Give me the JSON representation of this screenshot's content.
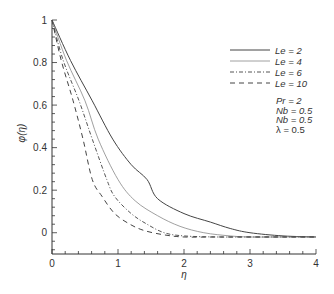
{
  "chart_data": {
    "type": "line",
    "title": "",
    "xlabel": "η",
    "ylabel": "φ(η)",
    "xlim": [
      0,
      4
    ],
    "ylim": [
      -0.1,
      1
    ],
    "xticks": [
      0,
      1,
      2,
      3,
      4
    ],
    "xtick_labels": [
      "0",
      "1",
      "2",
      "3",
      "4"
    ],
    "yticks": [
      0,
      0.2,
      0.4,
      0.6,
      0.8,
      1
    ],
    "ytick_labels": [
      "0",
      "0.2",
      "0.4",
      "0.6",
      "0.8",
      "1"
    ],
    "grid": false,
    "legend_position": "upper right",
    "series": [
      {
        "name": "Le = 2",
        "style": "solid",
        "color": "#444444",
        "x": [
          0,
          0.28,
          0.61,
          0.92,
          1.2,
          1.44,
          1.6,
          2.0,
          2.4,
          2.7,
          3.0,
          3.5,
          4.0
        ],
        "y": [
          1.0,
          0.81,
          0.62,
          0.44,
          0.32,
          0.25,
          0.16,
          0.09,
          0.05,
          0.02,
          0.0,
          -0.015,
          -0.02
        ]
      },
      {
        "name": "Le = 4",
        "style": "dotted-thin",
        "color": "#888888",
        "x": [
          0,
          0.22,
          0.5,
          0.7,
          1.0,
          1.26,
          1.6,
          1.94,
          2.3,
          2.7,
          3.0,
          3.5,
          4.0
        ],
        "y": [
          1.0,
          0.81,
          0.62,
          0.44,
          0.25,
          0.15,
          0.08,
          0.03,
          0.0,
          -0.015,
          -0.02,
          -0.02,
          -0.02
        ]
      },
      {
        "name": "Le = 6",
        "style": "dash-dot",
        "color": "#555555",
        "x": [
          0,
          0.17,
          0.41,
          0.61,
          0.83,
          0.95,
          1.2,
          1.44,
          1.7,
          2.0,
          2.5,
          3.0,
          3.5,
          4.0
        ],
        "y": [
          1.0,
          0.81,
          0.62,
          0.44,
          0.25,
          0.17,
          0.09,
          0.04,
          0.0,
          -0.015,
          -0.02,
          -0.02,
          -0.02,
          -0.02
        ]
      },
      {
        "name": "Le = 10",
        "style": "dashed",
        "color": "#444444",
        "x": [
          0,
          0.14,
          0.32,
          0.47,
          0.61,
          0.76,
          0.95,
          1.18,
          1.4,
          1.7,
          2.0,
          2.5,
          3.0,
          3.5,
          4.0
        ],
        "y": [
          1.0,
          0.81,
          0.62,
          0.44,
          0.25,
          0.17,
          0.09,
          0.04,
          0.01,
          -0.01,
          -0.02,
          -0.02,
          -0.02,
          -0.02,
          -0.02
        ]
      }
    ],
    "annotations": [
      "Pr = 2",
      "Nb = 0.5",
      "Nb = 0.5",
      "λ = 0.5"
    ]
  },
  "legend": {
    "items": [
      {
        "label": "Le = 2"
      },
      {
        "label": "Le = 4"
      },
      {
        "label": "Le = 6"
      },
      {
        "label": "Le = 10"
      }
    ]
  },
  "params": {
    "lines": [
      "Pr = 2",
      "Nb = 0.5",
      "Nb = 0.5",
      "λ = 0.5"
    ]
  }
}
